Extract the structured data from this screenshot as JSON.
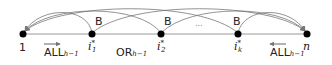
{
  "diagram": {
    "nodes": [
      {
        "id": "1",
        "label": "1",
        "x": 23
      },
      {
        "id": "i1",
        "label": "i",
        "sub": "1",
        "sup": "*",
        "x": 92
      },
      {
        "id": "i2",
        "label": "i",
        "sub": "2",
        "sup": "*",
        "x": 161
      },
      {
        "id": "ik",
        "label": "i",
        "sub": "k",
        "sup": "*",
        "x": 238
      },
      {
        "id": "n",
        "label": "n",
        "x": 307
      }
    ],
    "block_labels": [
      "B",
      "B",
      "B"
    ],
    "ellipsis": "...",
    "segments": [
      {
        "label": "ALL",
        "sub": "h−1",
        "arrow": "right"
      },
      {
        "label": "OR",
        "sub": "h−1"
      },
      {
        "label": "ALL",
        "sub": "h−1",
        "arrow": "left"
      }
    ],
    "colors": {
      "line": "#888888",
      "arc": "#777777",
      "node": "#000000",
      "text": "#222222"
    }
  }
}
